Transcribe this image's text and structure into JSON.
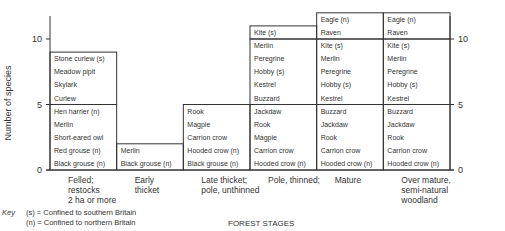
{
  "chart_data": {
    "type": "bar",
    "subtype": "stacked-labelled-blocks",
    "title": "",
    "xlabel": "FOREST STAGES",
    "ylabel": "Number of species",
    "ylim": [
      0,
      12
    ],
    "yticks": [
      0,
      5,
      10
    ],
    "grid": false,
    "categories": [
      [
        "Felled;",
        "restocks",
        "2 ha or more"
      ],
      [
        "Early",
        "thicket"
      ],
      [
        "Late thicket;",
        "pole, unthinned"
      ],
      [
        "Pole, thinned;"
      ],
      [
        "Mature"
      ],
      [
        "Over mature,",
        "semi-natural",
        "woodland"
      ]
    ],
    "values": [
      10,
      2,
      5,
      11,
      12,
      12
    ],
    "blocks": [
      [
        [
          "Black grouse (n)",
          "Red grouse (n)",
          "Short-eared owl",
          "Merlin",
          "Hen harrier (n)"
        ],
        [
          "Curlew",
          "Skylark",
          "Meadow pipit",
          "Stone curlew (s)"
        ]
      ],
      [
        [
          "Black grouse (n)",
          "Merlin"
        ]
      ],
      [
        [
          "Black grouse (n)",
          "Hooded crow (n)",
          "Carrion crow",
          "Magpie",
          "Rook"
        ]
      ],
      [
        [
          "Hooded crow (n)",
          "Carrion crow",
          "Magpie",
          "Rook",
          "Jackdaw"
        ],
        [
          "Buzzard",
          "Kestrel",
          "Hobby (s)",
          "Peregrine",
          "Merlin"
        ],
        [
          "Kite (s)"
        ]
      ],
      [
        [
          "Hooded crow (n)",
          "Carrion crow",
          "Rook",
          "Jackdaw",
          "Buzzard"
        ],
        [
          "Kestrel",
          "Hobby (s)",
          "Peregrine",
          "Merlin",
          "Kite (s)"
        ],
        [
          "Raven",
          "Eagle (n)"
        ]
      ],
      [
        [
          "Hooded crow (n)",
          "Carrion crow",
          "Rook",
          "Jackdaw",
          "Buzzard"
        ],
        [
          "Kestrel",
          "Hobby (s)",
          "Peregrine",
          "Merlin",
          "Kite (s)"
        ],
        [
          "Raven",
          "Eagle (n)"
        ]
      ]
    ],
    "key": {
      "label": "Key",
      "entries": [
        "(s) = Confined to southern Britain",
        "(n) = Confined to northern Britain"
      ]
    }
  }
}
